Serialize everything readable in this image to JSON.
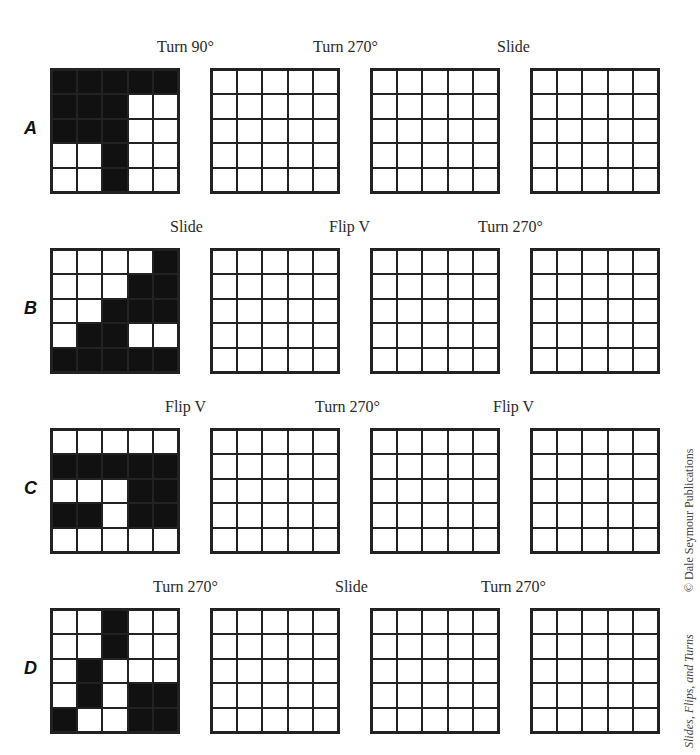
{
  "rows": [
    {
      "letter": "A",
      "labels": [
        "Turn 90°",
        "Turn 270°",
        "Slide"
      ],
      "given": [
        [
          1,
          1,
          1,
          1,
          1
        ],
        [
          1,
          1,
          1,
          0,
          0
        ],
        [
          1,
          1,
          1,
          0,
          0
        ],
        [
          0,
          0,
          1,
          0,
          0
        ],
        [
          0,
          0,
          1,
          0,
          0
        ]
      ]
    },
    {
      "letter": "B",
      "labels": [
        "Slide",
        "Flip V",
        "Turn 270°"
      ],
      "given": [
        [
          0,
          0,
          0,
          0,
          1
        ],
        [
          0,
          0,
          0,
          1,
          1
        ],
        [
          0,
          0,
          1,
          1,
          1
        ],
        [
          0,
          1,
          1,
          0,
          0
        ],
        [
          1,
          1,
          1,
          1,
          1
        ]
      ]
    },
    {
      "letter": "C",
      "labels": [
        "Flip V",
        "Turn 270°",
        "Flip V"
      ],
      "given": [
        [
          0,
          0,
          0,
          0,
          0
        ],
        [
          1,
          1,
          1,
          1,
          1
        ],
        [
          0,
          0,
          0,
          1,
          1
        ],
        [
          1,
          1,
          0,
          1,
          1
        ],
        [
          0,
          0,
          0,
          0,
          0
        ]
      ]
    },
    {
      "letter": "D",
      "labels": [
        "Turn 270°",
        "Slide",
        "Turn 270°"
      ],
      "given": [
        [
          0,
          0,
          1,
          0,
          0
        ],
        [
          0,
          0,
          1,
          0,
          0
        ],
        [
          0,
          1,
          0,
          0,
          0
        ],
        [
          0,
          1,
          0,
          1,
          1
        ],
        [
          1,
          0,
          0,
          1,
          1
        ]
      ]
    }
  ],
  "side_text": {
    "copyright": "© Dale Seymour Publications",
    "title": "Slides, Flips, and Turns"
  }
}
